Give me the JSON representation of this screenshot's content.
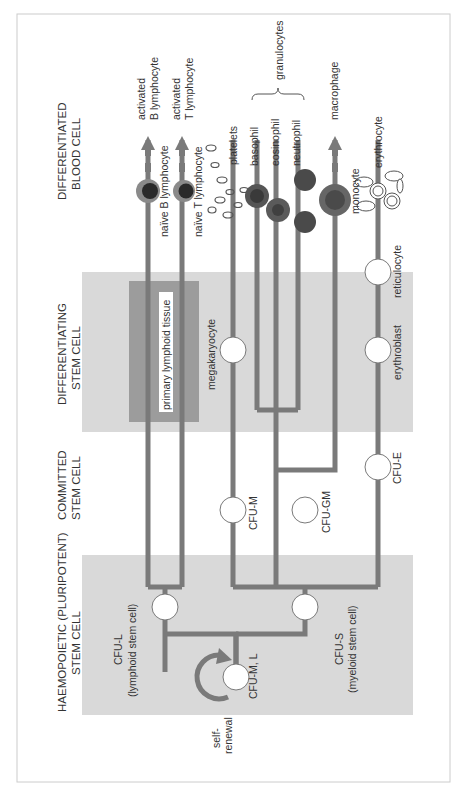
{
  "diagram": {
    "orientation": "rotated -90deg (read bottom-to-top)",
    "colors": {
      "line": "#7a7a7a",
      "band": "#d9d9d9",
      "lymphoid_box": "#9c9c9c",
      "node_fill": "#ffffff",
      "arrow": "#7a7a7a",
      "text": "#333333",
      "frame": "#cccccc"
    },
    "stage_headers": [
      {
        "id": "haemopoietic",
        "line1": "HAEMOPOIETIC (PLURIPOTENT)",
        "line2": "STEM CELL"
      },
      {
        "id": "committed",
        "line1": "COMMITTED",
        "line2": "STEM CELL"
      },
      {
        "id": "differentiating",
        "line1": "DIFFERENTIATING",
        "line2": "STEM CELL"
      },
      {
        "id": "differentiated",
        "line1": "DIFFERENTIATED",
        "line2": "BLOOD CELL"
      }
    ],
    "self_renewal": {
      "line1": "self-",
      "line2": "renewal"
    },
    "stem_cells": {
      "cfu_ml": "CFU-M, L",
      "cfu_l": {
        "line1": "CFU-L",
        "line2": "(lymphoid stem cell)"
      },
      "cfu_s": {
        "line1": "CFU-S",
        "line2": "(myeloid stem cell)"
      }
    },
    "committed": {
      "cfu_m": "CFU-M",
      "cfu_gm": "CFU-GM",
      "cfu_e": "CFU-E"
    },
    "differentiating": {
      "lymphoid_tissue": "primary lymphoid tissue",
      "megakaryocyte": "megakaryocyte",
      "erythroblast": "erythroblast",
      "reticulocyte": "reticulocyte"
    },
    "differentiated": {
      "naive_b": "naïve B lymphocyte",
      "naive_t": "naïve T lymphocyte",
      "activated_b": {
        "line1": "activated",
        "line2": "B lymphocyte"
      },
      "activated_t": {
        "line1": "activated",
        "line2": "T lymphocyte"
      },
      "platelets": "platelets",
      "basophil": "basophil",
      "eosinophil": "eosinophil",
      "neutrophil": "neutrophil",
      "granulocytes": "granulocytes",
      "monocyte": "monocyte",
      "macrophage": "macrophage",
      "erythrocyte": "erythrocyte"
    }
  }
}
